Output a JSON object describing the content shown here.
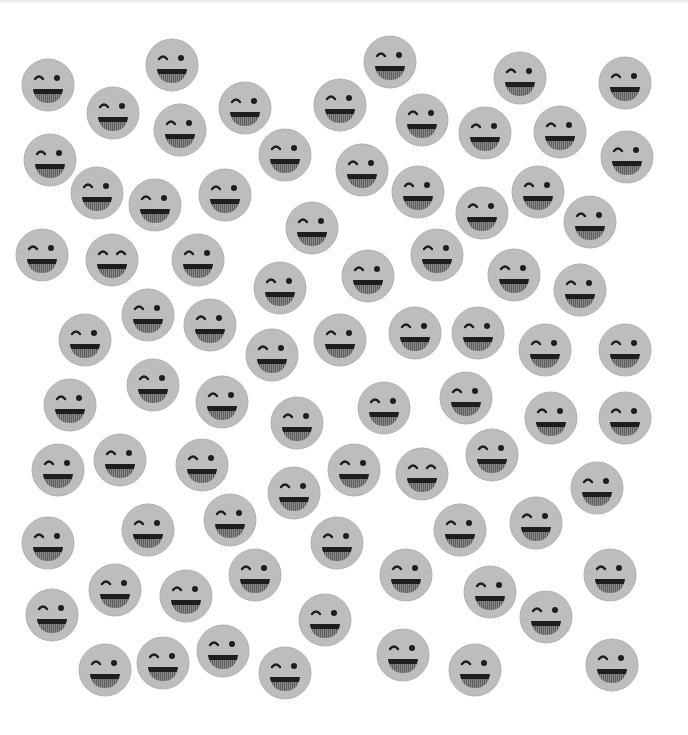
{
  "puzzle": {
    "description": "Grid of grey smiley faces; most are winking, a few have both eyes closed (odd ones out)",
    "face_radius": 26,
    "colors": {
      "background": "#ffffff",
      "face_fill": "#bdbdbd",
      "face_edge": "#b0b0b0",
      "features": "#1e1e1e",
      "tongue": "#7a7a7a"
    },
    "variants": {
      "wink": "left eye closed arc, right eye open dot, open laughing mouth",
      "laugh": "both eyes closed arcs, open laughing mouth"
    },
    "faces": [
      {
        "x": 48,
        "y": 85,
        "type": "wink"
      },
      {
        "x": 172,
        "y": 65,
        "type": "wink"
      },
      {
        "x": 390,
        "y": 62,
        "type": "wink"
      },
      {
        "x": 520,
        "y": 78,
        "type": "wink"
      },
      {
        "x": 625,
        "y": 83,
        "type": "wink"
      },
      {
        "x": 113,
        "y": 113,
        "type": "wink"
      },
      {
        "x": 180,
        "y": 130,
        "type": "wink"
      },
      {
        "x": 245,
        "y": 108,
        "type": "wink"
      },
      {
        "x": 340,
        "y": 105,
        "type": "wink"
      },
      {
        "x": 422,
        "y": 120,
        "type": "wink"
      },
      {
        "x": 485,
        "y": 133,
        "type": "wink"
      },
      {
        "x": 560,
        "y": 132,
        "type": "wink"
      },
      {
        "x": 627,
        "y": 157,
        "type": "wink"
      },
      {
        "x": 50,
        "y": 160,
        "type": "wink"
      },
      {
        "x": 285,
        "y": 155,
        "type": "wink"
      },
      {
        "x": 362,
        "y": 170,
        "type": "wink"
      },
      {
        "x": 97,
        "y": 193,
        "type": "wink"
      },
      {
        "x": 155,
        "y": 205,
        "type": "wink"
      },
      {
        "x": 225,
        "y": 195,
        "type": "wink"
      },
      {
        "x": 418,
        "y": 192,
        "type": "wink"
      },
      {
        "x": 538,
        "y": 192,
        "type": "wink"
      },
      {
        "x": 482,
        "y": 213,
        "type": "wink"
      },
      {
        "x": 590,
        "y": 222,
        "type": "wink"
      },
      {
        "x": 312,
        "y": 228,
        "type": "wink"
      },
      {
        "x": 42,
        "y": 255,
        "type": "wink"
      },
      {
        "x": 112,
        "y": 260,
        "type": "laugh"
      },
      {
        "x": 198,
        "y": 260,
        "type": "wink"
      },
      {
        "x": 437,
        "y": 255,
        "type": "wink"
      },
      {
        "x": 368,
        "y": 276,
        "type": "wink"
      },
      {
        "x": 280,
        "y": 288,
        "type": "wink"
      },
      {
        "x": 514,
        "y": 275,
        "type": "wink"
      },
      {
        "x": 580,
        "y": 290,
        "type": "wink"
      },
      {
        "x": 148,
        "y": 315,
        "type": "wink"
      },
      {
        "x": 210,
        "y": 325,
        "type": "wink"
      },
      {
        "x": 85,
        "y": 340,
        "type": "wink"
      },
      {
        "x": 272,
        "y": 355,
        "type": "wink"
      },
      {
        "x": 340,
        "y": 340,
        "type": "wink"
      },
      {
        "x": 415,
        "y": 333,
        "type": "wink"
      },
      {
        "x": 478,
        "y": 333,
        "type": "wink"
      },
      {
        "x": 545,
        "y": 350,
        "type": "wink"
      },
      {
        "x": 625,
        "y": 350,
        "type": "wink"
      },
      {
        "x": 70,
        "y": 405,
        "type": "wink"
      },
      {
        "x": 153,
        "y": 385,
        "type": "wink"
      },
      {
        "x": 222,
        "y": 402,
        "type": "wink"
      },
      {
        "x": 297,
        "y": 423,
        "type": "wink"
      },
      {
        "x": 384,
        "y": 408,
        "type": "wink"
      },
      {
        "x": 466,
        "y": 398,
        "type": "wink"
      },
      {
        "x": 551,
        "y": 418,
        "type": "wink"
      },
      {
        "x": 625,
        "y": 418,
        "type": "wink"
      },
      {
        "x": 58,
        "y": 470,
        "type": "wink"
      },
      {
        "x": 120,
        "y": 460,
        "type": "wink"
      },
      {
        "x": 202,
        "y": 465,
        "type": "wink"
      },
      {
        "x": 294,
        "y": 493,
        "type": "wink"
      },
      {
        "x": 354,
        "y": 470,
        "type": "wink"
      },
      {
        "x": 422,
        "y": 474,
        "type": "laugh"
      },
      {
        "x": 492,
        "y": 455,
        "type": "wink"
      },
      {
        "x": 597,
        "y": 488,
        "type": "wink"
      },
      {
        "x": 48,
        "y": 543,
        "type": "wink"
      },
      {
        "x": 148,
        "y": 530,
        "type": "wink"
      },
      {
        "x": 230,
        "y": 520,
        "type": "wink"
      },
      {
        "x": 337,
        "y": 543,
        "type": "wink"
      },
      {
        "x": 460,
        "y": 530,
        "type": "wink"
      },
      {
        "x": 536,
        "y": 523,
        "type": "wink"
      },
      {
        "x": 115,
        "y": 590,
        "type": "wink"
      },
      {
        "x": 186,
        "y": 596,
        "type": "wink"
      },
      {
        "x": 255,
        "y": 575,
        "type": "wink"
      },
      {
        "x": 406,
        "y": 575,
        "type": "wink"
      },
      {
        "x": 490,
        "y": 592,
        "type": "wink"
      },
      {
        "x": 546,
        "y": 617,
        "type": "wink"
      },
      {
        "x": 610,
        "y": 575,
        "type": "wink"
      },
      {
        "x": 52,
        "y": 615,
        "type": "wink"
      },
      {
        "x": 325,
        "y": 620,
        "type": "wink"
      },
      {
        "x": 105,
        "y": 670,
        "type": "wink"
      },
      {
        "x": 163,
        "y": 663,
        "type": "wink"
      },
      {
        "x": 223,
        "y": 651,
        "type": "wink"
      },
      {
        "x": 285,
        "y": 673,
        "type": "wink"
      },
      {
        "x": 403,
        "y": 655,
        "type": "wink"
      },
      {
        "x": 475,
        "y": 670,
        "type": "wink"
      },
      {
        "x": 612,
        "y": 665,
        "type": "wink"
      }
    ]
  }
}
